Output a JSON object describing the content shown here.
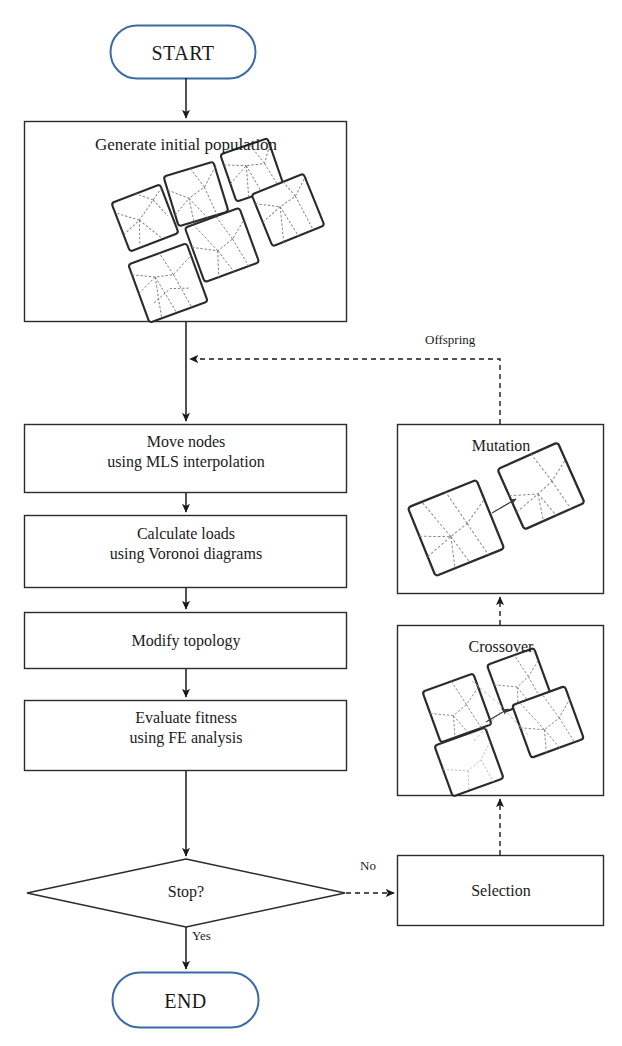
{
  "diagram": {
    "colors": {
      "terminal_stroke": "#3b6ba5",
      "box_stroke": "#2b2b2b",
      "text": "#1a1a1a",
      "connector": "#1a1a1a",
      "background": "#ffffff"
    },
    "nodes": {
      "start": {
        "label": "START",
        "shape": "terminal"
      },
      "generate": {
        "label": "Generate initial population",
        "shape": "process",
        "has_illustration": true,
        "illustration": "six-rotated-lattice-squares"
      },
      "move_nodes": {
        "label": "Move nodes\nusing MLS interpolation",
        "shape": "process"
      },
      "calculate_loads": {
        "label": "Calculate loads\nusing Voronoi diagrams",
        "shape": "process"
      },
      "modify_topology": {
        "label": "Modify topology",
        "shape": "process"
      },
      "evaluate_fitness": {
        "label": "Evaluate fitness\nusing FE analysis",
        "shape": "process"
      },
      "stop": {
        "label": "Stop?",
        "shape": "decision"
      },
      "end": {
        "label": "END",
        "shape": "terminal"
      },
      "selection": {
        "label": "Selection",
        "shape": "process"
      },
      "crossover": {
        "label": "Crossover",
        "shape": "process",
        "has_illustration": true,
        "illustration": "four-rotated-lattice-squares-with-arrow"
      },
      "mutation": {
        "label": "Mutation",
        "shape": "process",
        "has_illustration": true,
        "illustration": "two-rotated-lattice-squares-with-arrow"
      }
    },
    "edge_labels": {
      "no": "No",
      "yes": "Yes",
      "offspring": "Offspring"
    },
    "edges": [
      {
        "from": "start",
        "to": "generate",
        "style": "solid"
      },
      {
        "from": "generate",
        "to": "move_nodes",
        "style": "solid"
      },
      {
        "from": "move_nodes",
        "to": "calculate_loads",
        "style": "solid"
      },
      {
        "from": "calculate_loads",
        "to": "modify_topology",
        "style": "solid"
      },
      {
        "from": "modify_topology",
        "to": "evaluate_fitness",
        "style": "solid"
      },
      {
        "from": "evaluate_fitness",
        "to": "stop",
        "style": "solid"
      },
      {
        "from": "stop",
        "to": "end",
        "style": "solid",
        "label": "Yes"
      },
      {
        "from": "stop",
        "to": "selection",
        "style": "dashed",
        "label": "No"
      },
      {
        "from": "selection",
        "to": "crossover",
        "style": "dashed"
      },
      {
        "from": "crossover",
        "to": "mutation",
        "style": "dashed"
      },
      {
        "from": "mutation",
        "to": "move_nodes",
        "style": "dashed",
        "label": "Offspring"
      }
    ]
  }
}
